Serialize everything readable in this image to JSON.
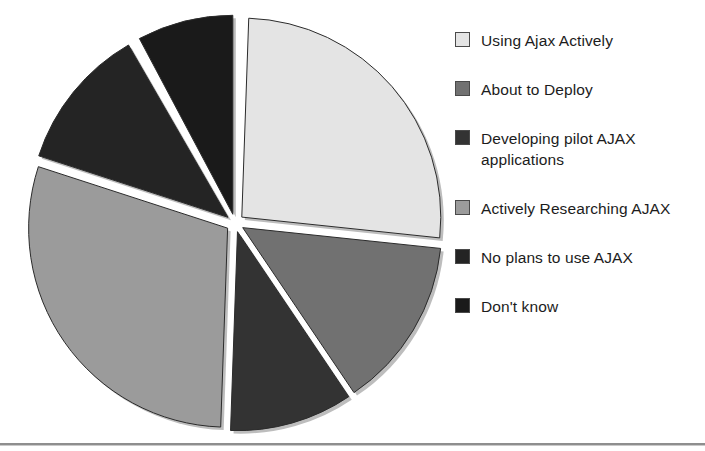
{
  "chart_data": {
    "type": "pie",
    "title": "",
    "xlabel": "",
    "ylabel": "",
    "legend_position": "right",
    "exploded": true,
    "categories": [
      "Using Ajax Actively",
      "About to Deploy",
      "Developing pilot AJAX applications",
      "Actively Researching AJAX",
      "No plans to use AJAX",
      "Don't know"
    ],
    "values": [
      26,
      14,
      10,
      24,
      16,
      10
    ],
    "units": "percent",
    "colors": [
      "#e4e4e4",
      "#717171",
      "#333333",
      "#9b9b9b",
      "#242424",
      "#1a1a1a"
    ],
    "slices": [
      {
        "label": "Using Ajax Actively",
        "value": 26,
        "color": "#e4e4e4",
        "start_angle": 2,
        "end_angle": 96
      },
      {
        "label": "About to Deploy",
        "value": 14,
        "color": "#717171",
        "start_angle": 96,
        "end_angle": 146
      },
      {
        "label": "Developing pilot AJAX applications",
        "value": 10,
        "color": "#333333",
        "start_angle": 146,
        "end_angle": 182
      },
      {
        "label": "Actively Researching AJAX",
        "value": 24,
        "color": "#9b9b9b",
        "start_angle": 182,
        "end_angle": 288
      },
      {
        "label": "No plans to use AJAX",
        "value": 16,
        "color": "#242424",
        "start_angle": 288,
        "end_angle": 330
      },
      {
        "label": "Don't know",
        "value": 10,
        "color": "#1a1a1a",
        "start_angle": 332,
        "end_angle": 360
      }
    ]
  },
  "legend": {
    "items": [
      {
        "label": "Using Ajax Actively",
        "swatch": "#e4e4e4"
      },
      {
        "label": "About to Deploy",
        "swatch": "#717171"
      },
      {
        "label": "Developing pilot AJAX applications",
        "swatch": "#333333"
      },
      {
        "label": "Actively Researching AJAX",
        "swatch": "#9b9b9b"
      },
      {
        "label": "No plans to use AJAX",
        "swatch": "#242424"
      },
      {
        "label": "Don't know",
        "swatch": "#1a1a1a"
      }
    ]
  }
}
